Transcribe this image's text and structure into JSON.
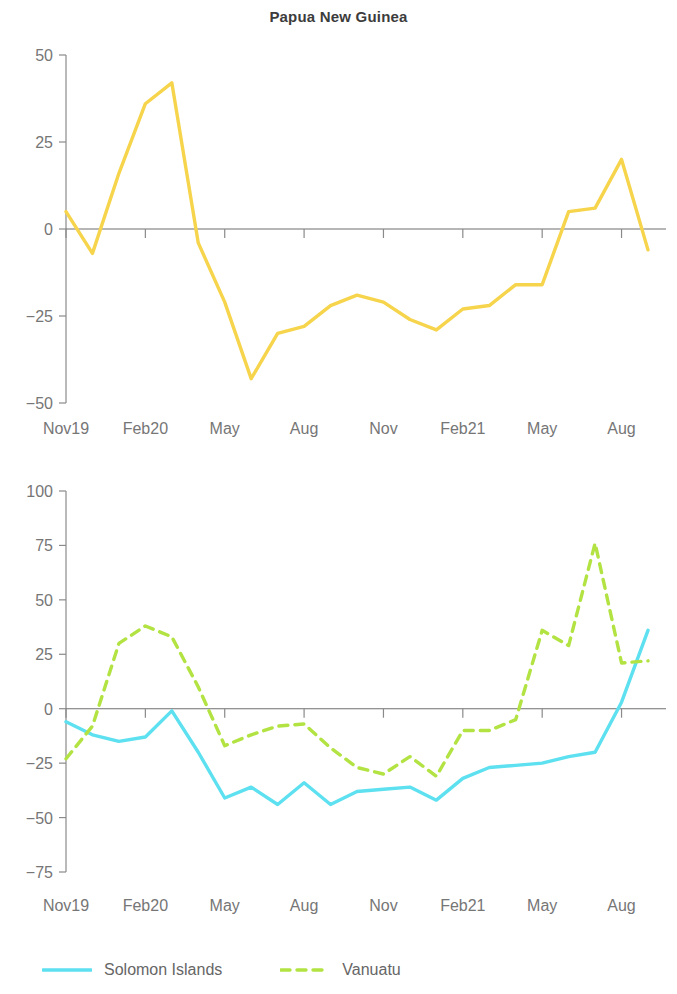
{
  "header": {
    "title": "Papua New Guinea"
  },
  "colors": {
    "papua_new_guinea": "#F6D44B",
    "solomon_islands": "#5DE0EF",
    "vanuatu": "#B2E342",
    "axis": "#8a8a8a",
    "zero_line": "#6f6f6f",
    "tick_text": "#767676",
    "title_text": "#3c3c3c"
  },
  "legend": {
    "position": "bottom",
    "items": [
      {
        "label": "Solomon Islands",
        "color": "#5DE0EF",
        "style": "solid",
        "name": "legend-item-solomon-islands"
      },
      {
        "label": "Vanuatu",
        "color": "#B2E342",
        "style": "dashed",
        "name": "legend-item-vanuatu"
      }
    ]
  },
  "chart_data": [
    {
      "id": "top",
      "type": "line",
      "title": "Papua New Guinea",
      "xlabel": "",
      "ylabel": "",
      "grid": false,
      "ylim": [
        -50,
        50
      ],
      "yticks": [
        50,
        25,
        0,
        -25,
        -50
      ],
      "ytick_labels": [
        "50",
        "25",
        "0",
        "−25",
        "−50"
      ],
      "xticks": [
        0,
        3,
        6,
        9,
        12,
        15,
        18,
        21
      ],
      "xtick_labels": [
        "Nov19",
        "Feb20",
        "May",
        "Aug",
        "Nov",
        "Feb21",
        "May",
        "Aug"
      ],
      "x": [
        0,
        1,
        2,
        3,
        4,
        5,
        6,
        7,
        8,
        9,
        10,
        11,
        12,
        13,
        14,
        15,
        16,
        17,
        18,
        19,
        20,
        21,
        22
      ],
      "x_labels_full": [
        "Nov19",
        "Dec19",
        "Jan20",
        "Feb20",
        "Mar20",
        "Apr20",
        "May20",
        "Jun20",
        "Jul20",
        "Aug20",
        "Sep20",
        "Oct20",
        "Nov20",
        "Dec20",
        "Jan21",
        "Feb21",
        "Mar21",
        "Apr21",
        "May21",
        "Jun21",
        "Jul21",
        "Aug21",
        "Sep21"
      ],
      "series": [
        {
          "name": "Papua New Guinea",
          "color": "#F6D44B",
          "style": "solid",
          "values": [
            5,
            -7,
            16,
            36,
            42,
            -4,
            -21,
            -43,
            -30,
            -28,
            -22,
            -19,
            -21,
            -26,
            -29,
            -23,
            -22,
            -16,
            -16,
            5,
            6,
            20,
            -6
          ]
        }
      ]
    },
    {
      "id": "bottom",
      "type": "line",
      "title": "",
      "xlabel": "",
      "ylabel": "",
      "grid": false,
      "ylim": [
        -75,
        100
      ],
      "yticks": [
        100,
        75,
        50,
        25,
        0,
        -25,
        -50,
        -75
      ],
      "ytick_labels": [
        "100",
        "75",
        "50",
        "25",
        "0",
        "−25",
        "−50",
        "−75"
      ],
      "xticks": [
        0,
        3,
        6,
        9,
        12,
        15,
        18,
        21
      ],
      "xtick_labels": [
        "Nov19",
        "Feb20",
        "May",
        "Aug",
        "Nov",
        "Feb21",
        "May",
        "Aug"
      ],
      "x": [
        0,
        1,
        2,
        3,
        4,
        5,
        6,
        7,
        8,
        9,
        10,
        11,
        12,
        13,
        14,
        15,
        16,
        17,
        18,
        19,
        20,
        21,
        22
      ],
      "x_labels_full": [
        "Nov19",
        "Dec19",
        "Jan20",
        "Feb20",
        "Mar20",
        "Apr20",
        "May20",
        "Jun20",
        "Jul20",
        "Aug20",
        "Sep20",
        "Oct20",
        "Nov20",
        "Dec20",
        "Jan21",
        "Feb21",
        "Mar21",
        "Apr21",
        "May21",
        "Jun21",
        "Jul21",
        "Aug21",
        "Sep21"
      ],
      "series": [
        {
          "name": "Solomon Islands",
          "color": "#5DE0EF",
          "style": "solid",
          "values": [
            -6,
            -12,
            -15,
            -13,
            -1,
            -20,
            -41,
            -36,
            -44,
            -34,
            -44,
            -38,
            -37,
            -36,
            -42,
            -32,
            -27,
            -26,
            -25,
            -22,
            -20,
            3,
            36
          ]
        },
        {
          "name": "Vanuatu",
          "color": "#B2E342",
          "style": "dashed",
          "values": [
            -23,
            -8,
            30,
            38,
            33,
            10,
            -17,
            -12,
            -8,
            -7,
            -18,
            -27,
            -30,
            -22,
            -31,
            -10,
            -10,
            -5,
            36,
            29,
            76,
            21,
            22
          ]
        }
      ]
    }
  ]
}
